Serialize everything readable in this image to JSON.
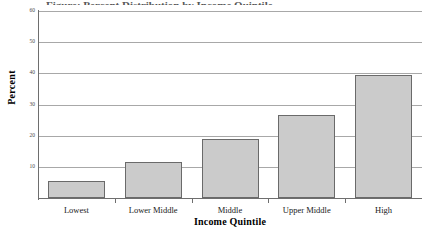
{
  "chart_data": {
    "type": "bar",
    "title": "",
    "title_clipped": "Figure: Percent Distribution by Income Quintile",
    "categories": [
      "Lowest",
      "Lower Middle",
      "Middle",
      "Upper Middle",
      "High"
    ],
    "values": [
      5.5,
      11.5,
      19,
      26.5,
      39.5
    ],
    "xlabel": "Income Quintile",
    "ylabel": "Percent",
    "ylim": [
      0,
      60
    ],
    "ytick_labels": [
      "10",
      "20",
      "30",
      "40",
      "50",
      "60"
    ],
    "ytick_values": [
      10,
      20,
      30,
      40,
      50,
      60
    ],
    "grid": "horizontal",
    "legend": "none",
    "bar_fill": "#cbcbcb",
    "bar_border": "#6a6a6a",
    "gridline_color": "#a8a8a8",
    "axis_color": "#6e6e6e",
    "background": "#ffffff"
  }
}
